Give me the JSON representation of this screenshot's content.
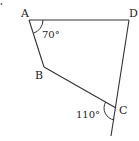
{
  "figure": {
    "type": "quadrilateral",
    "vertices": [
      {
        "name": "A",
        "label": "A",
        "x": 29,
        "y": 20
      },
      {
        "name": "B",
        "label": "B",
        "x": 44,
        "y": 67
      },
      {
        "name": "C",
        "label": "C",
        "x": 116,
        "y": 108
      },
      {
        "name": "D",
        "label": "D",
        "x": 129,
        "y": 20
      }
    ],
    "edges": [
      "AD",
      "AB",
      "BC",
      "DC"
    ],
    "extension": {
      "from": "D",
      "through": "C",
      "end_x": 111,
      "end_y": 136
    },
    "angles": [
      {
        "at": "A",
        "label": "70°",
        "between": "AD-AB"
      },
      {
        "at": "C",
        "label": "110°",
        "between": "CB-extension (exterior)"
      }
    ],
    "colors": {
      "line": "#333333",
      "text": "#222222",
      "background": "#ffffff"
    }
  }
}
